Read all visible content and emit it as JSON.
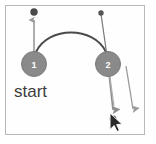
{
  "figure": {
    "title": "start",
    "background_color": "#ffffff",
    "frame_color": "#b9b9b9",
    "caption_text": "start",
    "nodes": [
      {
        "id": "node-1",
        "label": "1",
        "cx": 34,
        "cy": 64,
        "r": 12,
        "fill": "#8a8a8a",
        "stroke": "#787878"
      },
      {
        "id": "node-2",
        "label": "2",
        "cx": 108,
        "cy": 64,
        "r": 12,
        "fill": "#8a8a8a",
        "stroke": "#787878"
      }
    ],
    "endpoints": [
      {
        "id": "endpoint-top-left",
        "cx": 34,
        "cy": 12,
        "r": 3.6,
        "fill": "#4a4a4a"
      },
      {
        "id": "endpoint-top-right",
        "cx": 101,
        "cy": 13,
        "r": 2.6,
        "fill": "#555555"
      },
      {
        "id": "endpoint-bottom",
        "cx": 113,
        "cy": 120,
        "r": 3.4,
        "fill": "#4a4a4a"
      }
    ],
    "arc": {
      "id": "motion-arc",
      "from_node": "1",
      "to_node": "2",
      "color": "#4a4a4a",
      "width": 1.8,
      "path": "M 36 52 C 48 26, 94 26, 106 52"
    },
    "vectors": [
      {
        "id": "vector-up-left",
        "direction": "up",
        "color": "#9a9a9a",
        "x1": 34,
        "y1": 63,
        "x2": 34,
        "y2": 16
      },
      {
        "id": "vector-down-from-node-2",
        "direction": "down",
        "color": "#8f8f8f",
        "x1": 108,
        "y1": 64,
        "x2": 113,
        "y2": 115
      },
      {
        "id": "vector-diagonal-into-node-2",
        "direction": "down-left",
        "color": "#777777",
        "x1": 101,
        "y1": 14,
        "x2": 108,
        "y2": 62
      },
      {
        "id": "vector-right-down",
        "direction": "down",
        "color": "#9a9a9a",
        "x1": 126,
        "y1": 66,
        "x2": 134,
        "y2": 114
      }
    ],
    "cursor": {
      "id": "mouse-pointer",
      "x": 110,
      "y": 116,
      "fill": "#2b2b2b",
      "stroke": "#ffffff"
    }
  }
}
